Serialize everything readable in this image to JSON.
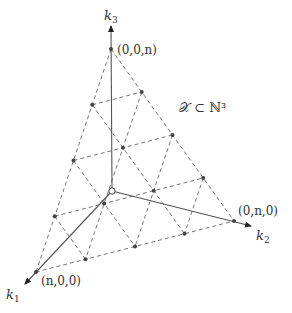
{
  "diagram": {
    "set_label": "𝒳 ⊂ ℕ³",
    "axes": [
      {
        "name": "k1",
        "label_main": "k",
        "label_sub": "1"
      },
      {
        "name": "k2",
        "label_main": "k",
        "label_sub": "2"
      },
      {
        "name": "k3",
        "label_main": "k",
        "label_sub": "3"
      }
    ],
    "vertices": [
      {
        "id": "k3-vertex",
        "label": "(0,0,n)"
      },
      {
        "id": "k2-vertex",
        "label": "(0,n,0)"
      },
      {
        "id": "k1-vertex",
        "label": "(n,0,0)"
      }
    ],
    "lattice_divisions": 4,
    "colors": {
      "axis": "#555555",
      "dashed": "#666666",
      "point": "#444444",
      "text": "#333333"
    }
  }
}
